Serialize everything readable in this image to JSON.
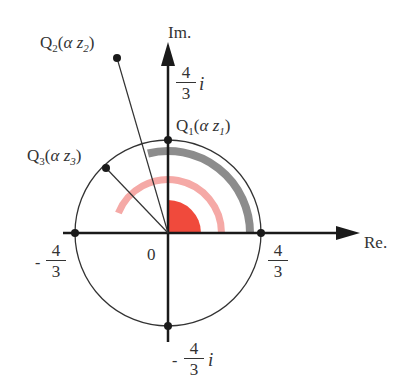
{
  "axes": {
    "x_label": "Re.",
    "y_label": "Im.",
    "origin_label": "0"
  },
  "ticks": {
    "re_pos": {
      "num": "4",
      "den": "3",
      "sign": ""
    },
    "re_neg": {
      "num": "4",
      "den": "3",
      "sign": "-"
    },
    "im_pos": {
      "num": "4",
      "den": "3",
      "sign": "",
      "unit": "i"
    },
    "im_neg": {
      "num": "4",
      "den": "3",
      "sign": "-",
      "unit": "i"
    }
  },
  "points": [
    {
      "name": "Q",
      "sub": "1",
      "arg": "α z",
      "arg_sub": "1"
    },
    {
      "name": "Q",
      "sub": "2",
      "arg": "α z",
      "arg_sub": "2"
    },
    {
      "name": "Q",
      "sub": "3",
      "arg": "α z",
      "arg_sub": "3"
    }
  ],
  "colors": {
    "axis": "#1a1a1a",
    "circle": "#333333",
    "red_sector": "#f04a3c",
    "pink_arc": "#f5a9a6",
    "gray_arc": "#8c8c8c"
  }
}
